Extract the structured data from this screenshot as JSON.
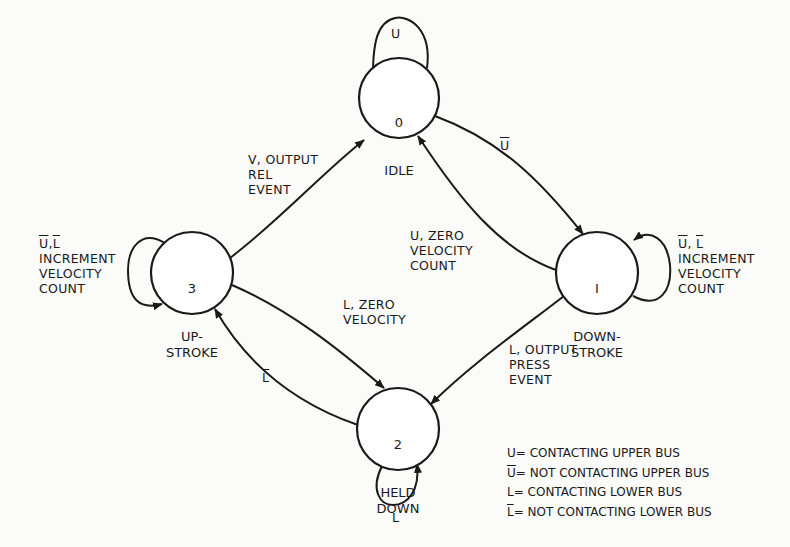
{
  "diagram": {
    "type": "state-machine",
    "nodes": [
      {
        "id": "0",
        "number": "0",
        "name": "IDLE"
      },
      {
        "id": "1",
        "number": "1",
        "name": "DOWN-\nSTROKE"
      },
      {
        "id": "2",
        "number": "2",
        "name": "HELD\nDOWN"
      },
      {
        "id": "3",
        "number": "3",
        "name": "UP-\nSTROKE"
      }
    ],
    "edges": [
      {
        "from": "0",
        "to": "0",
        "label": "U"
      },
      {
        "from": "0",
        "to": "1",
        "label": "Ū"
      },
      {
        "from": "1",
        "to": "0",
        "label": "U, ZERO\nVELOCITY\nCOUNT"
      },
      {
        "from": "1",
        "to": "1",
        "label_cond": "Ū, L̄",
        "label_action": "INCREMENT\nVELOCITY\nCOUNT"
      },
      {
        "from": "1",
        "to": "2",
        "label": "L, OUTPUT\nPRESS\nEVENT"
      },
      {
        "from": "2",
        "to": "2",
        "label": "L"
      },
      {
        "from": "2",
        "to": "3",
        "label": "L̄"
      },
      {
        "from": "3",
        "to": "2",
        "label": "L, ZERO\nVELOCITY"
      },
      {
        "from": "3",
        "to": "0",
        "label": "V, OUTPUT\nREL\nEVENT"
      },
      {
        "from": "3",
        "to": "3",
        "label_cond": "Ū, L̄",
        "label_action": "INCREMENT\nVELOCITY\nCOUNT"
      }
    ]
  },
  "nodes": {
    "n0": {
      "number": "0",
      "name": "IDLE"
    },
    "n1": {
      "number": "I",
      "name": "DOWN-\nSTROKE"
    },
    "n2": {
      "number": "2",
      "name": "HELD\nDOWN"
    },
    "n3": {
      "number": "3",
      "name": "UP-\nSTROKE"
    }
  },
  "labels": {
    "self0": "U",
    "e01": "U",
    "e10": "U, ZERO\nVELOCITY\nCOUNT",
    "self1_cond_a": "U",
    "self1_cond_sep": ", ",
    "self1_cond_b": "L",
    "self1_action": "INCREMENT\nVELOCITY\nCOUNT",
    "e12": "L, OUTPUT\nPRESS\nEVENT",
    "self2": "L",
    "e23": "L",
    "e32": "L, ZERO\nVELOCITY",
    "e30": "V, OUTPUT\nREL\nEVENT",
    "self3_cond_a": "U",
    "self3_cond_sep": ",",
    "self3_cond_b": "L",
    "self3_action": "INCREMENT\nVELOCITY\nCOUNT"
  },
  "legend": [
    {
      "symbol": "U",
      "overbar": false,
      "text": "= CONTACTING UPPER BUS"
    },
    {
      "symbol": "U",
      "overbar": true,
      "text": "= NOT CONTACTING UPPER BUS"
    },
    {
      "symbol": "L",
      "overbar": false,
      "text": "= CONTACTING LOWER BUS"
    },
    {
      "symbol": "L",
      "overbar": true,
      "text": "= NOT CONTACTING LOWER BUS"
    }
  ]
}
